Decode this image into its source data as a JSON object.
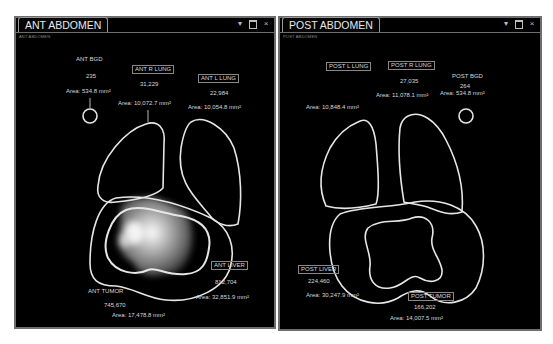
{
  "panels": [
    {
      "title": "ANT ABDOMEN",
      "subtitle": "ANT ABDOMEN",
      "controls": [
        "dropdown-icon",
        "window-icon",
        "close-icon"
      ],
      "rois": {
        "bgd": {
          "name": "ANT BGD",
          "counts": "235",
          "area": "Area: 534.8 mm²"
        },
        "r_lung": {
          "name": "ANT R LUNG",
          "counts": "31,229",
          "area": "Area: 10,072.7 mm²"
        },
        "l_lung": {
          "name": "ANT L LUNG",
          "counts": "22,984",
          "area": "Area: 10,054.8 mm²"
        },
        "liver": {
          "name": "ANT LIVER",
          "counts": "812,704",
          "area": "Area: 32,851.9 mm²"
        },
        "tumor": {
          "name": "ANT TUMOR",
          "counts": "745,670",
          "area": "Area: 17,478.8 mm²"
        }
      }
    },
    {
      "title": "POST ABDOMEN",
      "subtitle": "POST ABDOMEN",
      "controls": [
        "dropdown-icon",
        "window-icon",
        "close-icon"
      ],
      "rois": {
        "l_lung": {
          "name": "POST L LUNG",
          "counts": "",
          "area": "Area: 10,848.4 mm²"
        },
        "r_lung": {
          "name": "POST R LUNG",
          "counts": "27,035",
          "area": "Area: 11,078.1 mm²"
        },
        "bgd": {
          "name": "POST BGD",
          "counts": "264",
          "area": "Area: 534.8 mm²"
        },
        "liver": {
          "name": "POST LIVER",
          "counts": "224,460",
          "area": "Area: 30,247.9 mm²"
        },
        "tumor": {
          "name": "POST TUMOR",
          "counts": "166,202",
          "area": "Area: 14,007.5 mm²"
        }
      }
    }
  ],
  "colors": {
    "background": "#000000",
    "contour": "#e6e6e6",
    "frame": "#6e6e6e",
    "text": "#d8d8d8"
  }
}
